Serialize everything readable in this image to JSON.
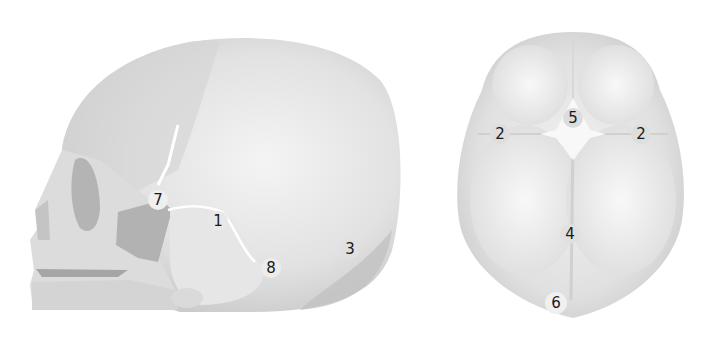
{
  "diagram": {
    "type": "anatomical-illustration",
    "views": [
      {
        "name": "lateral-view",
        "labels": [
          {
            "id": "7",
            "text": "7",
            "x": 158,
            "y": 200
          },
          {
            "id": "1",
            "text": "1",
            "x": 218,
            "y": 221
          },
          {
            "id": "8",
            "text": "8",
            "x": 271,
            "y": 268
          },
          {
            "id": "3",
            "text": "3",
            "x": 350,
            "y": 249
          }
        ]
      },
      {
        "name": "superior-view",
        "labels": [
          {
            "id": "5",
            "text": "5",
            "x": 573,
            "y": 118
          },
          {
            "id": "2-left",
            "text": "2",
            "x": 500,
            "y": 134
          },
          {
            "id": "2-right",
            "text": "2",
            "x": 641,
            "y": 134
          },
          {
            "id": "4",
            "text": "4",
            "x": 570,
            "y": 234
          },
          {
            "id": "6",
            "text": "6",
            "x": 556,
            "y": 303
          }
        ]
      }
    ],
    "colors": {
      "bone_light": "#ececec",
      "bone_mid": "#d8d8d8",
      "bone_dark": "#bdbdbd",
      "shadow": "#a8a8a8",
      "suture": "#ffffff",
      "label_text": "#1a1a1a"
    }
  }
}
